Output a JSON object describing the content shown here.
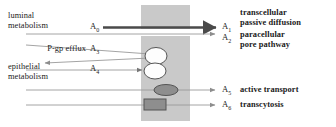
{
  "figure": {
    "membrane_color": "#c9c9c9",
    "line_color": "#9a9a9a",
    "thick_line_color": "#4a4a4a",
    "shape_outline_color": "#555555",
    "shape_fill_white": "#fdfdfd",
    "shape_fill_gray": "#8e8e8e",
    "text_color": "#1a1a1a"
  },
  "left_labels": [
    {
      "id": "luminal-metabolism",
      "line1": "luminal",
      "line2": "metabolism"
    },
    {
      "id": "pgp-efflux",
      "line1": "P-gp efflux",
      "line2": ""
    },
    {
      "id": "epithelial-metabolism",
      "line1": "epithelial",
      "line2": "metabolism"
    }
  ],
  "left_symbols": [
    {
      "id": "A0",
      "text": "A",
      "sub": "0"
    },
    {
      "id": "A3",
      "text": "A",
      "sub": "3"
    },
    {
      "id": "A4",
      "text": "A",
      "sub": "4"
    }
  ],
  "right_symbols": [
    {
      "id": "A1",
      "text": "A",
      "sub": "1"
    },
    {
      "id": "A2",
      "text": "A",
      "sub": "2"
    },
    {
      "id": "A5",
      "text": "A",
      "sub": "5"
    },
    {
      "id": "A6",
      "text": "A",
      "sub": "6"
    }
  ],
  "right_labels": [
    {
      "id": "transcellular-passive-diffusion",
      "line1": "transcellular",
      "line2": "passive diffusion"
    },
    {
      "id": "paracellular-pore-pathway",
      "line1": "paracellular",
      "line2": "pore pathway"
    },
    {
      "id": "active-transport",
      "line1": "active transport",
      "line2": ""
    },
    {
      "id": "transcytosis",
      "line1": "transcytosis",
      "line2": ""
    }
  ]
}
